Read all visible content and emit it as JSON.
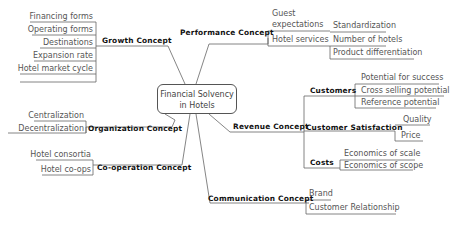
{
  "center": {
    "line1": "Financial Solvency",
    "line2": "in Hotels"
  },
  "growth": {
    "label": "Growth Concept",
    "items": [
      "Financing forms",
      "Operating forms",
      "Destinations",
      "Expansion rate",
      "Hotel market cycle"
    ]
  },
  "performance": {
    "label": "Performance Concept",
    "guest_line1": "Guest",
    "guest_line2": "expectations",
    "hotel_services": "Hotel services",
    "hotel_services_items": [
      "Standardization",
      "Number of hotels",
      "Product differentiation"
    ]
  },
  "organization": {
    "label": "Organization Concept",
    "items": [
      "Centralization",
      "Decentralization"
    ]
  },
  "cooperation": {
    "label": "Co-operation Concept",
    "items": [
      "Hotel consortia",
      "Hotel co-ops"
    ]
  },
  "revenue": {
    "label": "Revenue Concept",
    "customers": {
      "label": "Customers",
      "items": [
        "Potential for success",
        "Cross selling potential",
        "Reference potential"
      ]
    },
    "satisfaction": {
      "label": "Customer Satisfaction",
      "items": [
        "Quality",
        "Price"
      ]
    },
    "costs": {
      "label": "Costs",
      "items": [
        "Economics of scale",
        "Economics of scope"
      ]
    }
  },
  "communication": {
    "label": "Communication Concept",
    "items": [
      "Brand",
      "Customer Relationship"
    ]
  },
  "colors": {
    "line": "#555555",
    "text": "#555555",
    "bold_text": "#111111",
    "background": "#ffffff"
  }
}
